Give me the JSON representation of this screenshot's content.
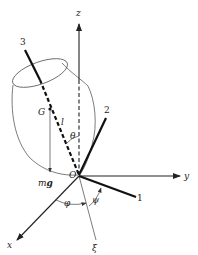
{
  "figure": {
    "labels": {
      "z_axis": "z",
      "y_axis": "y",
      "x_axis": "x",
      "body_axis_1": "1",
      "body_axis_2": "2",
      "body_axis_3": "3",
      "center_of_mass": "G",
      "origin": "O",
      "length": "l",
      "theta": "θ",
      "phi": "φ",
      "psi": "ψ",
      "xi": "ξ",
      "weight_m": "m",
      "weight_g": "g"
    },
    "colors": {
      "ink": "#222222",
      "background": "#ffffff"
    }
  }
}
